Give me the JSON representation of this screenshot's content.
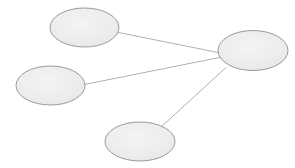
{
  "diagram": {
    "type": "node-link-graph",
    "title": "",
    "width": 295,
    "height": 168,
    "background_color": "#ffffff",
    "node_fill_color": "#ebebeb",
    "node_fill_color_light": "#f2f2f2",
    "node_stroke_color": "#9a9a9a",
    "node_stroke_width": 1,
    "edge_stroke_color": "#a8a8a8",
    "edge_stroke_width": 0.9,
    "topology": "star",
    "node_count": 4,
    "edge_count": 3,
    "nodes": [
      {
        "id": "node-top-left",
        "label": "",
        "cx": 84.5,
        "cy": 27.5,
        "rx": 34.5,
        "ry": 19.5
      },
      {
        "id": "node-hub-right",
        "label": "",
        "cx": 253,
        "cy": 50.5,
        "rx": 35,
        "ry": 20
      },
      {
        "id": "node-left",
        "label": "",
        "cx": 50.5,
        "cy": 85.5,
        "rx": 34.5,
        "ry": 19.5
      },
      {
        "id": "node-bottom",
        "label": "",
        "cx": 140,
        "cy": 141.5,
        "rx": 35,
        "ry": 19.5
      }
    ],
    "edges": [
      {
        "id": "edge-top-left-to-hub",
        "source": "node-top-left",
        "target": "node-hub-right",
        "label": "",
        "x1": 118.5,
        "y1": 32.5,
        "x2": 220.5,
        "y2": 53
      },
      {
        "id": "edge-left-to-hub",
        "source": "node-left",
        "target": "node-hub-right",
        "label": "",
        "x1": 84.5,
        "y1": 84.5,
        "x2": 219.5,
        "y2": 57.5
      },
      {
        "id": "edge-bottom-to-hub",
        "source": "node-bottom",
        "target": "node-hub-right",
        "label": "",
        "x1": 160,
        "y1": 128,
        "x2": 226,
        "y2": 67.5
      }
    ]
  }
}
